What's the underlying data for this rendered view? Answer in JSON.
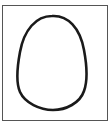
{
  "figure": {
    "shape": "egg-oval-outline",
    "stroke_color": "#1a1a1a",
    "frame_color": "#555555",
    "background": "#ffffff"
  }
}
